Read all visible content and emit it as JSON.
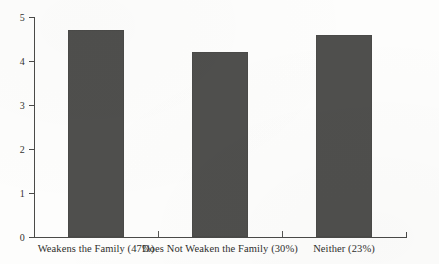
{
  "chart_data": {
    "type": "bar",
    "title": "",
    "subtitle": "",
    "xlabel": "",
    "ylabel": "",
    "categories": [
      "Weakens the Family (47%)",
      "Does Not Weaken the Family (30%)",
      "Neither (23%)"
    ],
    "values": [
      4.7,
      4.2,
      4.6
    ],
    "ylim": [
      0,
      5
    ],
    "yticks": [
      "0",
      "1",
      "2",
      "3",
      "4",
      "5"
    ],
    "grid": false,
    "legend": null,
    "bar_color": "#4f4f4d",
    "axis_color": "#4a4a48"
  }
}
